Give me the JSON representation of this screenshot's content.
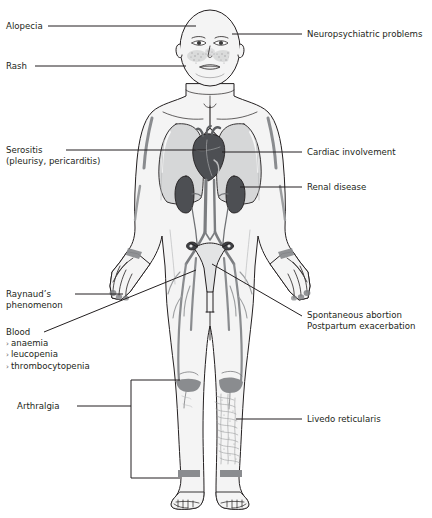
{
  "diagram": {
    "figure_name": "female-body-anterior-view",
    "colors": {
      "outline": "#231f20",
      "skin_fill": "#f4f4f4",
      "organ_dark": "#4d4f53",
      "organ_mid": "#8a8c8f",
      "organ_light": "#c9cacb",
      "vessel": "#7b7d80",
      "leader_line": "#231f20",
      "text": "#231f20"
    }
  },
  "labels_left": [
    {
      "id": "alopecia",
      "text": "Alopecia",
      "x": 6,
      "y": 22
    },
    {
      "id": "rash",
      "text": "Rash",
      "x": 6,
      "y": 62
    },
    {
      "id": "serositis",
      "text": "Serositis",
      "x": 6,
      "y": 145,
      "sub": "(pleurisy, pericarditis)"
    },
    {
      "id": "raynauds",
      "text": "Raynaud’s",
      "x": 6,
      "y": 290,
      "sub": "phenomenon"
    },
    {
      "id": "arthralgia",
      "text": "Arthralgia",
      "x": 17,
      "y": 402
    }
  ],
  "blood_block": {
    "heading": "Blood",
    "x": 6,
    "y": 328,
    "items": [
      "anaemia",
      "leucopenia",
      "thrombocytopenia"
    ],
    "bullet_glyph": "›"
  },
  "labels_right": [
    {
      "id": "neuropsychiatric",
      "text": "Neuropsychiatric problems",
      "x": 307,
      "y": 31
    },
    {
      "id": "cardiac",
      "text": "Cardiac involvement",
      "x": 307,
      "y": 148
    },
    {
      "id": "renal",
      "text": "Renal disease",
      "x": 307,
      "y": 183
    },
    {
      "id": "pregnancy",
      "text": "Spontaneous abortion",
      "x": 307,
      "y": 311,
      "sub": "Postpartum exacerbation"
    },
    {
      "id": "livedo",
      "text": "Livedo reticularis",
      "x": 307,
      "y": 415
    }
  ],
  "body_regions": [
    {
      "name": "scalp",
      "finding": "Alopecia"
    },
    {
      "name": "malar-cheeks",
      "finding": "Butterfly rash"
    },
    {
      "name": "brain",
      "finding": "Neuropsychiatric problems"
    },
    {
      "name": "lungs-pleura",
      "finding": "Pleurisy"
    },
    {
      "name": "heart",
      "finding": "Pericarditis / cardiac involvement"
    },
    {
      "name": "kidneys",
      "finding": "Renal disease"
    },
    {
      "name": "uterus",
      "finding": "Spontaneous abortion"
    },
    {
      "name": "fingers",
      "finding": "Raynaud’s phenomenon"
    },
    {
      "name": "knees-ankles",
      "finding": "Arthralgia"
    },
    {
      "name": "lower-leg",
      "finding": "Livedo reticularis"
    }
  ]
}
